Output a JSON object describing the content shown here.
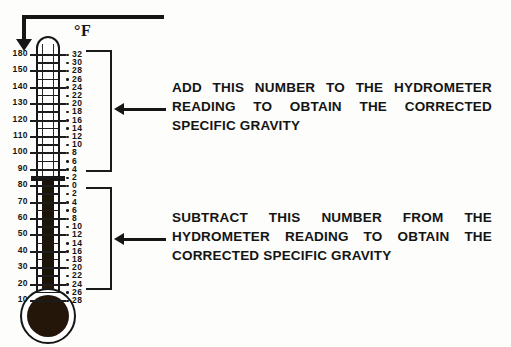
{
  "figure": {
    "unit_label": "°F",
    "pointer": {
      "name": "top-pointer-arrow"
    }
  },
  "thermometer": {
    "temperature_scale": {
      "unit": "°F",
      "labels": [
        "180",
        "150",
        "140",
        "130",
        "120",
        "110",
        "100",
        "90",
        "80",
        "70",
        "60",
        "50",
        "40",
        "30",
        "20",
        "10"
      ]
    },
    "correction_scale": {
      "add_labels": [
        "32",
        "30",
        "28",
        "26",
        "24",
        "22",
        "20",
        "18",
        "16",
        "14",
        "12",
        "10",
        "8",
        "6",
        "4",
        "2"
      ],
      "zero_label": "0",
      "subtract_labels": [
        "2",
        "4",
        "6",
        "8",
        "10",
        "12",
        "14",
        "16",
        "18",
        "20",
        "22",
        "24",
        "26",
        "28"
      ]
    },
    "mercury_level_label": "80",
    "mercury_color": "#241709"
  },
  "annotations": {
    "add": {
      "lines": [
        "ADD THIS NUMBER TO THE HYDROMETER",
        "READING TO OBTAIN THE CORRECTED",
        "SPECIFIC GRAVITY"
      ]
    },
    "subtract": {
      "lines": [
        "SUBTRACT THIS NUMBER FROM THE",
        "HYDROMETER READING TO OBTAIN THE",
        "CORRECTED SPECIFIC GRAVITY"
      ]
    }
  },
  "colors": {
    "ink": "#161616",
    "background": "#fdfdfb"
  }
}
